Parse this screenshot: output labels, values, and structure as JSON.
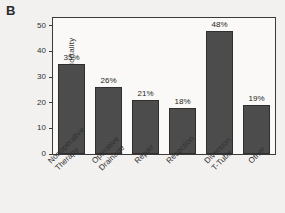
{
  "panel": {
    "label": "B"
  },
  "chart_data": {
    "type": "bar",
    "title": "",
    "subtitle": "",
    "xlabel": "",
    "ylabel": "% Mortality",
    "ylim": [
      0,
      53
    ],
    "yticks": [
      0,
      10,
      20,
      30,
      40,
      50
    ],
    "ytick_labels": [
      "0",
      "10",
      "20",
      "30",
      "40",
      "50"
    ],
    "grid": false,
    "legend": false,
    "legend_position": "none",
    "bar_color": "#4c4c4c",
    "bar_edge_color": "#2e2e2e",
    "categories": [
      "Nonoperative Therapy",
      "Operative Drainage",
      "Repair",
      "Resection",
      "Diversion T-Tube",
      "Other"
    ],
    "category_lines": [
      [
        "Nonoperative",
        "Therapy"
      ],
      [
        "Operative",
        "Drainage"
      ],
      [
        "Repair",
        ""
      ],
      [
        "Resection",
        ""
      ],
      [
        "Diversion",
        "T-Tube"
      ],
      [
        "Other",
        ""
      ]
    ],
    "values": [
      35,
      26,
      21,
      18,
      48,
      19
    ],
    "data_labels": [
      "35%",
      "26%",
      "21%",
      "18%",
      "48%",
      "19%"
    ],
    "annotations": [
      "B"
    ]
  }
}
